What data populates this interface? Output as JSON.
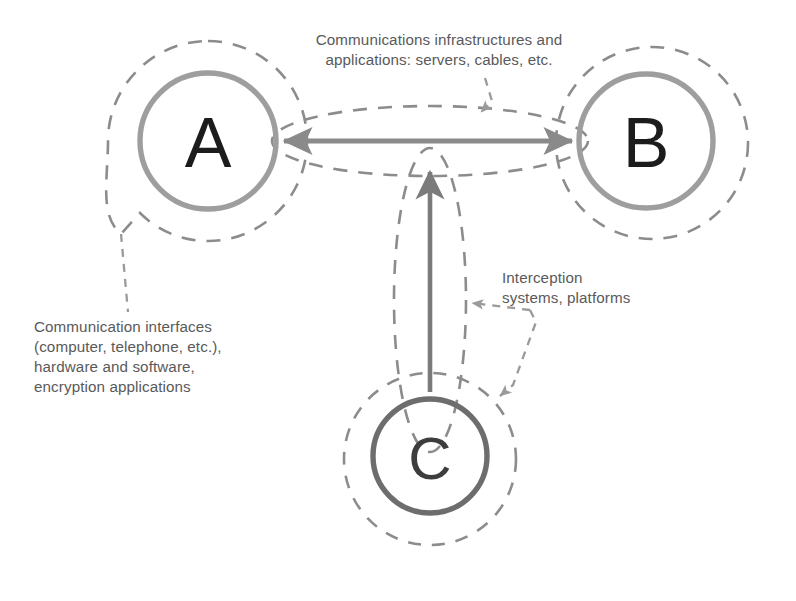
{
  "diagram": {
    "background_color": "#ffffff",
    "palette": {
      "node_ring_light": "#9e9e9e",
      "node_ring_dark": "#6d6d6d",
      "dashed_outline": "#8c8c8c",
      "arrow_solid": "#8a8a8a",
      "arrow_solid_dark": "#6f6f6f",
      "leader_dashed": "#9a9a9a",
      "text": "#5a5a5a",
      "letter": "#1c1c1c"
    },
    "nodes": [
      {
        "id": "node-a",
        "label": "A",
        "role": "communicating party",
        "center": [
          208,
          141
        ],
        "ring_radius": 68,
        "boundary_radius": 100,
        "ring_color": "#9e9e9e"
      },
      {
        "id": "node-b",
        "label": "B",
        "role": "communicating party",
        "center": [
          646,
          141
        ],
        "ring_radius": 67,
        "boundary_radius": 96,
        "ring_color": "#9e9e9e"
      },
      {
        "id": "node-c",
        "label": "C",
        "role": "interceptor",
        "center": [
          430,
          456
        ],
        "ring_radius": 57,
        "boundary_radius": 86,
        "ring_color": "#6d6d6d"
      }
    ],
    "connections": [
      {
        "id": "link-a-b",
        "from": "A",
        "to": "B",
        "style": "double-headed solid arrow",
        "annotated_by": "caption-infrastructure"
      },
      {
        "id": "link-c-a-b",
        "from": "C",
        "to": "channel A-B",
        "style": "single-headed solid arrow pointing up",
        "annotated_by": "caption-interception"
      }
    ],
    "captions": {
      "infrastructure": "Communications infrastructures and\napplications: servers, cables, etc.",
      "interfaces": "Communication interfaces\n(computer, telephone, etc.),\nhardware and software,\nencryption applications",
      "interception": "Interception\nsystems, platforms"
    },
    "leaders": [
      {
        "id": "leader-infrastructure",
        "from": "caption-infrastructure",
        "to": "channel envelope A-B",
        "style": "dashed with arrowhead"
      },
      {
        "id": "leader-interfaces",
        "from": "node-a boundary",
        "to": "caption-interfaces",
        "style": "dashed, no arrowhead"
      },
      {
        "id": "leader-interception",
        "from": "caption-interception",
        "to": "interception path envelope and node-c boundary",
        "style": "dashed with two arrowheads"
      }
    ]
  }
}
